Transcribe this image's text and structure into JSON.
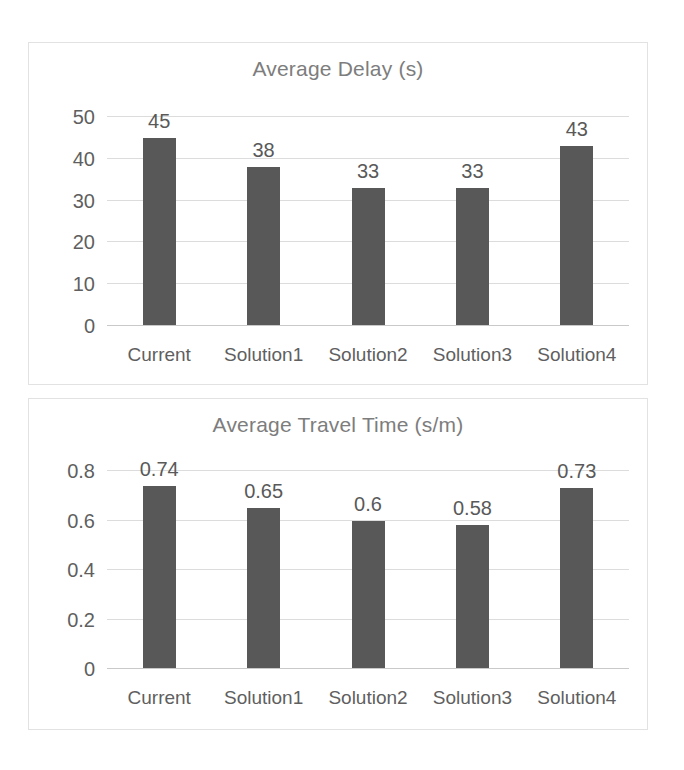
{
  "page": {
    "background": "#ffffff",
    "bar_color": "#585858",
    "grid_color": "#dcdcdc",
    "title_color": "#7d7d7d",
    "label_color": "#5f5f5f"
  },
  "chart_data": [
    {
      "type": "bar",
      "title": "Average Delay (s)",
      "xlabel": "",
      "ylabel": "",
      "categories": [
        "Current",
        "Solution1",
        "Solution2",
        "Solution3",
        "Solution4"
      ],
      "values": [
        45,
        38,
        33,
        33,
        43
      ],
      "data_labels": [
        "45",
        "38",
        "33",
        "33",
        "43"
      ],
      "yticks": [
        0,
        10,
        20,
        30,
        40,
        50
      ],
      "ytick_labels": [
        "0",
        "10",
        "20",
        "30",
        "40",
        "50"
      ],
      "ylim": [
        0,
        50
      ],
      "grid": true,
      "legend": "none"
    },
    {
      "type": "bar",
      "title": "Average Travel Time (s/m)",
      "xlabel": "",
      "ylabel": "",
      "categories": [
        "Current",
        "Solution1",
        "Solution2",
        "Solution3",
        "Solution4"
      ],
      "values": [
        0.74,
        0.65,
        0.6,
        0.58,
        0.73
      ],
      "data_labels": [
        "0.74",
        "0.65",
        "0.6",
        "0.58",
        "0.73"
      ],
      "yticks": [
        0,
        0.2,
        0.4,
        0.6,
        0.8
      ],
      "ytick_labels": [
        "0",
        "0.2",
        "0.4",
        "0.6",
        "0.8"
      ],
      "ylim": [
        0,
        0.8
      ],
      "grid": true,
      "legend": "none"
    }
  ]
}
